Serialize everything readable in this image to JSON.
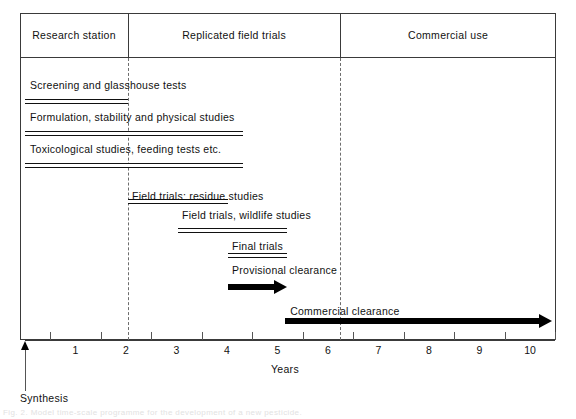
{
  "figure": {
    "axis_title": "Years",
    "origin_marker_label": "Synthesis",
    "caption": "Fig. 2. Model time-scale programme for the development of a new pesticide.",
    "colors": {
      "frame": "#3a3a3a",
      "bar_outline": "#111111",
      "arrow_fill": "#000000",
      "separator": "#6d6d6d",
      "background": "#ffffff"
    }
  },
  "header": {
    "phases": [
      {
        "label": "Research station",
        "start_year": 0.0,
        "end_year": 2.04
      },
      {
        "label": "Replicated field trials",
        "start_year": 2.04,
        "end_year": 6.24
      },
      {
        "label": "Commercial use",
        "start_year": 6.24,
        "end_year": 10.5
      }
    ]
  },
  "chart_data": {
    "type": "bar",
    "orientation": "horizontal",
    "xlabel": "Years",
    "ylabel": "",
    "xlim": [
      0,
      10.5
    ],
    "grid": false,
    "legend": "none",
    "xticks": [
      0,
      1,
      2,
      3,
      4,
      5,
      6,
      7,
      8,
      9,
      10
    ],
    "xticklabels": [
      "1",
      "2",
      "3",
      "4",
      "5",
      "6",
      "7",
      "8",
      "9",
      "10"
    ],
    "tick_mark_positions": [
      0.5,
      1.5,
      2.5,
      3.5,
      4.5,
      5.5,
      6.5,
      7.5,
      8.5,
      9.5,
      10.5
    ],
    "phase_separators": [
      2.04,
      6.24
    ],
    "categories": [
      "Screening and glasshouse tests",
      "Formulation, stability and physical studies",
      "Toxicological studies, feeding tests etc.",
      "Field trials; residue studies",
      "Field trials, wildlife studies",
      "Final trials",
      "Provisional clearance",
      "Commercial clearance"
    ],
    "bars": [
      {
        "label": "Screening and glasshouse tests",
        "start": 0.0,
        "end": 2.04,
        "duration": 2.04,
        "style": "hollow-bar",
        "label_x": 0.1,
        "row": 0
      },
      {
        "label": "Formulation, stability and physical studies",
        "start": 0.0,
        "end": 4.32,
        "duration": 4.32,
        "style": "hollow-bar",
        "label_x": 0.1,
        "row": 1
      },
      {
        "label": "Toxicological studies, feeding tests etc.",
        "start": 0.0,
        "end": 4.32,
        "duration": 4.32,
        "style": "hollow-bar",
        "label_x": 0.1,
        "row": 2
      },
      {
        "label": "Field trials; residue studies",
        "start": 2.04,
        "end": 4.02,
        "duration": 1.98,
        "style": "hollow-bar",
        "label_x": 2.12,
        "row": 3
      },
      {
        "label": "Field trials, wildlife studies",
        "start": 3.03,
        "end": 5.19,
        "duration": 2.16,
        "style": "hollow-bar",
        "label_x": 3.11,
        "row": 4
      },
      {
        "label": "Final trials",
        "start": 4.02,
        "end": 5.19,
        "duration": 1.17,
        "style": "hollow-bar",
        "label_x": 4.1,
        "row": 5
      },
      {
        "label": "Provisional clearance",
        "start": 4.02,
        "end": 5.19,
        "duration": 1.17,
        "style": "solid-arrow",
        "label_x": 4.1,
        "row": 6
      },
      {
        "label": "Commercial clearance",
        "start": 5.15,
        "end": 10.44,
        "duration": 5.29,
        "style": "solid-arrow",
        "label_x": 5.25,
        "row": 7
      }
    ],
    "annotations": [
      {
        "text": "Synthesis",
        "x": 0.0,
        "type": "origin-marker",
        "arrow": "up"
      }
    ]
  }
}
